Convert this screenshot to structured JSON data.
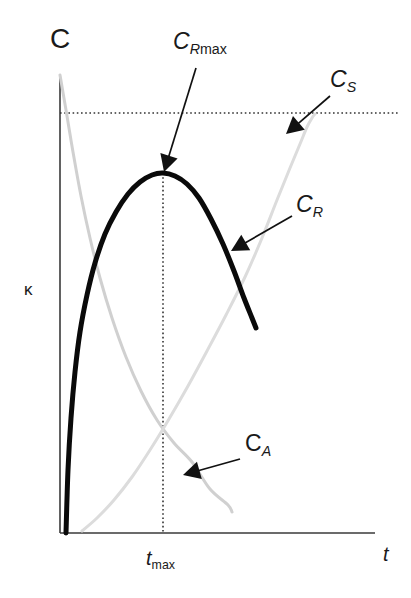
{
  "figure": {
    "background_color": "#ffffff",
    "width": 411,
    "height": 598
  },
  "axes": {
    "y_axis_top_label": "C",
    "y_axis_side_label": "κ",
    "x_axis_label": "t",
    "axis_color": "#222222",
    "x_axis_y": 533,
    "y_axis_x": 60,
    "x_axis_start": 60,
    "x_axis_end": 375,
    "y_axis_top": 75,
    "grid": false
  },
  "guides": {
    "horizontal_dotted": {
      "name": "saturation-level-line",
      "y": 113,
      "x_start": 60,
      "x_end": 400,
      "style": "dotted",
      "color": "#333333"
    },
    "vertical_dotted": {
      "name": "t-max-line",
      "x": 163,
      "y_start": 173,
      "y_end": 533,
      "style": "dotted",
      "color": "#333333",
      "tick_label": "t_max",
      "tick_label_italic_part": "t",
      "tick_label_sub_part": "max"
    }
  },
  "annotations": [
    {
      "id": "CRmax",
      "text_main": "C",
      "text_sub_italic": "R",
      "text_sub_roman": "max",
      "display": "C_R max",
      "label_x": 173,
      "label_y": 30,
      "arrow_tail_x": 196,
      "arrow_tail_y": 68,
      "arrow_tip_x": 164,
      "arrow_tip_y": 172,
      "arrow_color": "#111111"
    },
    {
      "id": "CS",
      "text_main": "C",
      "text_sub_italic": "S",
      "text_sub_roman": "",
      "display": "C_S",
      "label_x": 330,
      "label_y": 68,
      "arrow_tail_x": 330,
      "arrow_tail_y": 96,
      "arrow_tip_x": 286,
      "arrow_tip_y": 134,
      "arrow_color": "#111111"
    },
    {
      "id": "CR",
      "text_main": "C",
      "text_sub_italic": "R",
      "text_sub_roman": "",
      "display": "C_R",
      "label_x": 296,
      "label_y": 193,
      "arrow_tail_x": 292,
      "arrow_tail_y": 216,
      "arrow_tip_x": 231,
      "arrow_tip_y": 251,
      "arrow_color": "#111111"
    },
    {
      "id": "CA",
      "text_main": "C",
      "text_sub_italic": "A",
      "text_sub_roman": "",
      "display": "C_A",
      "label_x": 245,
      "label_y": 432,
      "arrow_tail_x": 240,
      "arrow_tail_y": 459,
      "arrow_tip_x": 183,
      "arrow_tip_y": 475,
      "arrow_color": "#111111"
    }
  ],
  "chart_data": {
    "type": "line",
    "title": "",
    "subtitle": "",
    "xlabel": "t",
    "ylabel": "C",
    "ylabel_secondary": "κ",
    "xlim": [
      0,
      1
    ],
    "ylim": [
      0,
      1
    ],
    "grid": false,
    "legend_position": "inline-annotations",
    "tick_labels": {
      "x": [
        "t_max"
      ],
      "y": []
    },
    "annotations": [
      "C_R max",
      "C_S",
      "C_R",
      "C_A"
    ],
    "series": [
      {
        "name": "C_A",
        "label": "C_A",
        "color": "#d0d0d0",
        "width": 3,
        "description": "exponential decay of reactant A from initial concentration to near zero",
        "points": [
          [
            60,
            75
          ],
          [
            66,
            110
          ],
          [
            73,
            152
          ],
          [
            81,
            196
          ],
          [
            90,
            238
          ],
          [
            100,
            278
          ],
          [
            112,
            318
          ],
          [
            126,
            357
          ],
          [
            141,
            391
          ],
          [
            157,
            420
          ],
          [
            174,
            443
          ],
          [
            192,
            462
          ],
          [
            210,
            489
          ],
          [
            228,
            505
          ],
          [
            232,
            512
          ]
        ]
      },
      {
        "name": "C_S",
        "label": "C_S",
        "color": "#dcdcdc",
        "width": 3,
        "description": "saturating rise of final product S asymptotic to the dotted saturation level",
        "points": [
          [
            82,
            531
          ],
          [
            97,
            518
          ],
          [
            114,
            500
          ],
          [
            132,
            477
          ],
          [
            150,
            450
          ],
          [
            169,
            419
          ],
          [
            188,
            386
          ],
          [
            207,
            351
          ],
          [
            226,
            315
          ],
          [
            245,
            277
          ],
          [
            262,
            238
          ],
          [
            277,
            200
          ],
          [
            290,
            168
          ],
          [
            300,
            144
          ],
          [
            307,
            127
          ],
          [
            312,
            118
          ],
          [
            315,
            114
          ]
        ]
      },
      {
        "name": "C_R",
        "label": "C_R",
        "color": "#0a0a0a",
        "width": 5,
        "description": "intermediate R rises steeply, reaches maximum C_R max at t_max, then decays",
        "max_point": [
          163,
          173
        ],
        "points": [
          [
            66,
            533
          ],
          [
            68,
            470
          ],
          [
            71,
            418
          ],
          [
            75,
            372
          ],
          [
            80,
            332
          ],
          [
            87,
            295
          ],
          [
            95,
            263
          ],
          [
            105,
            234
          ],
          [
            116,
            212
          ],
          [
            128,
            194
          ],
          [
            140,
            182
          ],
          [
            152,
            175
          ],
          [
            163,
            173
          ],
          [
            175,
            176
          ],
          [
            187,
            184
          ],
          [
            199,
            198
          ],
          [
            211,
            219
          ],
          [
            223,
            244
          ],
          [
            234,
            271
          ],
          [
            244,
            298
          ],
          [
            252,
            318
          ],
          [
            256,
            328
          ]
        ]
      }
    ]
  }
}
